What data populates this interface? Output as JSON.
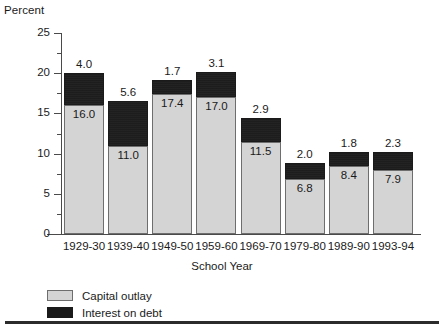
{
  "chart_data": {
    "type": "bar",
    "subtype": "stacked-vertical",
    "title": "",
    "ylabel": "Percent",
    "xlabel": "School Year",
    "ylim": [
      0,
      25
    ],
    "ytick_values": [
      0,
      5,
      10,
      15,
      20,
      25
    ],
    "ytick_labels": [
      "0",
      "5",
      "10",
      "15",
      "20",
      "25"
    ],
    "yminor_values": [
      2.5,
      7.5,
      12.5,
      17.5,
      22.5
    ],
    "grid": false,
    "legend_position": "bottom-left",
    "categories": [
      "1929-30",
      "1939-40",
      "1949-50",
      "1959-60",
      "1969-70",
      "1979-80",
      "1989-90",
      "1993-94"
    ],
    "series": [
      {
        "name": "Capital outlay",
        "color": "#d4d4d4",
        "values": [
          16.0,
          11.0,
          17.4,
          17.0,
          11.5,
          6.8,
          8.4,
          7.9
        ],
        "labels": [
          "16.0",
          "11.0",
          "17.4",
          "17.0",
          "11.5",
          "6.8",
          "8.4",
          "7.9"
        ]
      },
      {
        "name": "Interest on debt",
        "color": "#1a1a1a",
        "values": [
          4.0,
          5.6,
          1.7,
          3.1,
          2.9,
          2.0,
          1.8,
          2.3
        ],
        "labels": [
          "4.0",
          "5.6",
          "1.7",
          "3.1",
          "2.9",
          "2.0",
          "1.8",
          "2.3"
        ]
      }
    ],
    "totals": [
      20.0,
      16.6,
      19.1,
      20.1,
      14.4,
      8.8,
      10.2,
      10.2
    ]
  },
  "legend": {
    "items": [
      {
        "label": "Capital outlay",
        "color": "#d4d4d4"
      },
      {
        "label": "Interest on debt",
        "color": "#1a1a1a"
      }
    ]
  }
}
